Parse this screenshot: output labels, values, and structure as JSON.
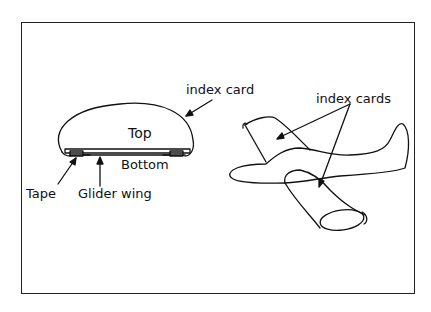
{
  "diagram": {
    "title": "",
    "left_figure": {
      "labels": {
        "index_card": "index card",
        "top": "Top",
        "bottom": "Bottom",
        "tape": "Tape",
        "glider_wing": "Glider wing"
      }
    },
    "right_figure": {
      "labels": {
        "index_cards": "index cards"
      }
    },
    "colors": {
      "line": "#111111",
      "background": "#ffffff"
    }
  }
}
